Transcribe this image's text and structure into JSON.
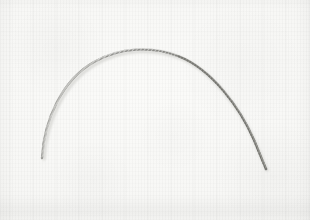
{
  "image": {
    "kind": "natural-photograph",
    "subject_label": "curved twisted metal wire",
    "title": "Arched twisted wire filament on pale paper background",
    "orientation": "landscape",
    "width_px": 310,
    "height_px": 220
  },
  "background": {
    "name": "pale textured paper sheet",
    "base_color": "#f6f6f4",
    "highlight_color": "#fbfbf9",
    "shadow_color": "#eeeeec",
    "texture": "fine woven scan lines",
    "bottom_edge_color": "#e4e4e1"
  },
  "subject": {
    "name": "wire-arch",
    "material": "twisted steel strand",
    "stroke_core_color": "#9a9a97",
    "stroke_dark_color": "#7c7c79",
    "stroke_light_color": "#c9c9c5",
    "shadow_color": "#d8d8d4",
    "shape": "open downward-opening arc",
    "thickness_px": 2,
    "left_end": {
      "x": 42,
      "y": 158
    },
    "apex": {
      "x": 157,
      "y": 51
    },
    "right_end": {
      "x": 266,
      "y": 169
    },
    "path": "M 42,158 C 44,120 62,80 94,62 C 120,47 152,46 178,56 C 212,69 240,108 254,140 C 259,152 263,162 266,169",
    "highlight_path": "M 43,156 C 45,119 63,79 95,61 C 121,46 153,45 179,55 C 212,68 240,107 254,139 C 259,151 263,161 266,168",
    "shadow_path": "M 44,159 C 46,122 64,82 96,64 C 122,49 154,48 180,58 C 213,71 241,110 255,142 C 260,154 264,163 267,170",
    "limb_note": "right limb renders darker and slightly thicker than left limb"
  },
  "accessibility": {
    "alt_text": "A thin twisted metal wire bent into a wide arch, photographed from above on a plain off-white paper surface."
  }
}
